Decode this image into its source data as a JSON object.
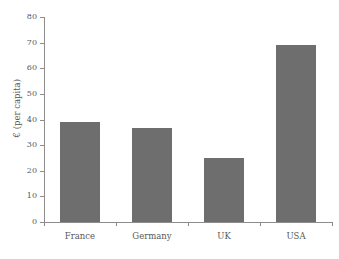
{
  "chart_data": {
    "type": "bar",
    "title": "",
    "subtitle": "",
    "xlabel": "",
    "ylabel": "€ (per capita)",
    "categories": [
      "France",
      "Germany",
      "UK",
      "USA"
    ],
    "values": [
      39,
      36.5,
      25,
      69
    ],
    "series": [
      {
        "name": "€ (per capita)",
        "values": [
          39,
          36.5,
          25,
          69
        ]
      }
    ],
    "ylim": [
      0,
      80
    ],
    "yticks": [
      0,
      10,
      20,
      30,
      40,
      50,
      60,
      70,
      80
    ],
    "ytick_labels": [
      "0",
      "10",
      "20",
      "30",
      "40",
      "50",
      "60",
      "70",
      "80"
    ],
    "grid": false,
    "legend": false,
    "legend_position": "none",
    "annotations": [],
    "bar_color": "#6e6e6e",
    "axis_color": "#8c8c8c",
    "text_color": "#58585a",
    "background_color": "#ffffff"
  }
}
